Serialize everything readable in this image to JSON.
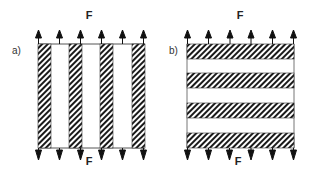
{
  "panels": [
    {
      "id": "a",
      "label": "a)",
      "force_top": "F",
      "force_bottom": "F",
      "orientation": "vertical-stripes",
      "stripe_count": 4,
      "arrow_count": 6
    },
    {
      "id": "b",
      "label": "b)",
      "force_top": "F",
      "force_bottom": "F",
      "orientation": "horizontal-stripes",
      "stripe_count": 4,
      "arrow_count": 6
    }
  ],
  "colors": {
    "stripe_fill": "#1a1a1a",
    "outline": "#555555",
    "arrow": "#111111"
  }
}
